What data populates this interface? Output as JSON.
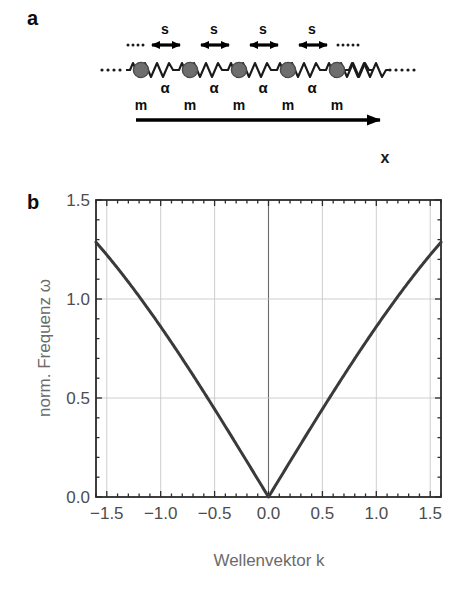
{
  "figure": {
    "panels": [
      {
        "id": "a",
        "label": "a"
      },
      {
        "id": "b",
        "label": "b"
      }
    ]
  },
  "panel_a": {
    "title_label": "a",
    "description": "one-dimensional monoatomic chain of masses m connected by springs with force constant alpha",
    "axis_label": "x",
    "spring_constant_label": "α",
    "mass_label": "m",
    "spacing_label": "s",
    "ellipsis_left": "…",
    "ellipsis_right": "…",
    "atom_count": 5,
    "atom_color": "#6e6e6e",
    "atom_edge_color": "#4a4a4a",
    "spring_color": "#1a1a1a",
    "arrow_color": "#000000",
    "atoms": [
      {
        "x": 141,
        "mass_label": "m"
      },
      {
        "x": 190,
        "mass_label": "m"
      },
      {
        "x": 239,
        "mass_label": "m"
      },
      {
        "x": 288,
        "mass_label": "m"
      },
      {
        "x": 337,
        "mass_label": "m"
      }
    ],
    "spacing_arrows": [
      {
        "x": 165,
        "label": "s"
      },
      {
        "x": 214,
        "label": "s"
      },
      {
        "x": 263,
        "label": "s"
      },
      {
        "x": 312,
        "label": "s"
      }
    ],
    "alpha_labels": [
      {
        "x": 165,
        "label": "α"
      },
      {
        "x": 214,
        "label": "α"
      },
      {
        "x": 263,
        "label": "α"
      },
      {
        "x": 312,
        "label": "α"
      }
    ]
  },
  "chart_data": {
    "type": "line",
    "title": "",
    "xlabel": "Wellenvektor k",
    "ylabel": "norm. Frequenz ω",
    "xlim": [
      -1.6,
      1.6
    ],
    "ylim": [
      0.0,
      1.5
    ],
    "xticks": [
      -1.5,
      -1.0,
      -0.5,
      0.0,
      0.5,
      1.0,
      1.5
    ],
    "xticklabels": [
      "−1.5",
      "−1.0",
      "−0.5",
      "0.0",
      "0.5",
      "1.0",
      "1.5"
    ],
    "yticks": [
      0.0,
      0.5,
      1.0,
      1.5
    ],
    "yticklabels": [
      "0.0",
      "0.5",
      "1.0",
      "1.5"
    ],
    "minor_ticks": true,
    "grid": true,
    "grid_color": "#c8c8c8",
    "frame_color": "#2b2b2b",
    "legend": null,
    "curve_color": "#3a3a3a",
    "curve_width": 3,
    "formula": "omega = 1.2247 * |sin(k/2)| / sin(0.75)",
    "series": [
      {
        "name": "akustischer Zweig",
        "x": [
          -1.6,
          -1.5,
          -1.4,
          -1.3,
          -1.2,
          -1.1,
          -1.0,
          -0.9,
          -0.8,
          -0.7,
          -0.6,
          -0.5,
          -0.4,
          -0.3,
          -0.2,
          -0.1,
          0.0,
          0.1,
          0.2,
          0.3,
          0.4,
          0.5,
          0.6,
          0.7,
          0.8,
          0.9,
          1.0,
          1.1,
          1.2,
          1.3,
          1.4,
          1.5,
          1.6
        ],
        "y": [
          1.281,
          1.223,
          1.162,
          1.097,
          1.029,
          0.958,
          0.883,
          0.806,
          0.726,
          0.644,
          0.559,
          0.472,
          0.383,
          0.292,
          0.2,
          0.107,
          0.0,
          0.107,
          0.2,
          0.292,
          0.383,
          0.472,
          0.559,
          0.644,
          0.726,
          0.806,
          0.883,
          0.958,
          1.029,
          1.097,
          1.162,
          1.223,
          1.281
        ]
      }
    ],
    "annotations": [
      {
        "text": "ω(k=0) = 0",
        "k": 0.0,
        "omega": 0.0
      },
      {
        "text": "ω(k=±1.5) ≈ 1.22",
        "k": 1.5,
        "omega": 1.223
      }
    ]
  }
}
